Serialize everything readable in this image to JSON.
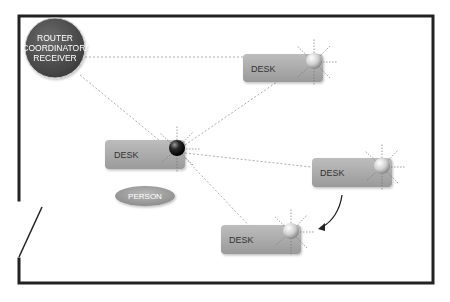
{
  "diagram": {
    "router": {
      "line1": "ROUTER",
      "line2": "COORDINATOR/",
      "line3": "RECEIVER"
    },
    "desks": [
      {
        "id": "desk-top-right",
        "label": "DESK",
        "sensor": "light"
      },
      {
        "id": "desk-center-left",
        "label": "DESK",
        "sensor": "dark"
      },
      {
        "id": "desk-right",
        "label": "DESK",
        "sensor": "light"
      },
      {
        "id": "desk-bottom",
        "label": "DESK",
        "sensor": "light"
      }
    ],
    "person": {
      "label": "PERSON"
    },
    "colors": {
      "wall": "#222222",
      "router": "#555555",
      "desk": "#a8a8a8",
      "person": "#a0a0a0",
      "connection": "#999999"
    }
  }
}
